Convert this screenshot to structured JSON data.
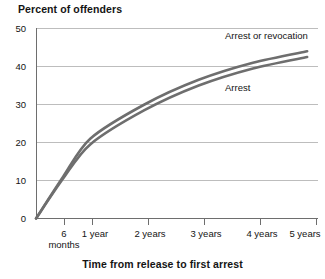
{
  "chart_data": {
    "type": "line",
    "title": "",
    "ylabel": "Percent of offenders",
    "xlabel": "Time from release to first arrest",
    "ylim": [
      0,
      50
    ],
    "yticks": [
      0,
      10,
      20,
      30,
      40,
      50
    ],
    "grid": true,
    "legend_position": "inline-labels",
    "categories": [
      "6 months",
      "1 year",
      "2 years",
      "3 years",
      "4 years",
      "5 years"
    ],
    "x_positions_years": [
      0.5,
      1,
      2,
      3,
      4,
      5
    ],
    "xlim_years": [
      0,
      5.2
    ],
    "series": [
      {
        "name": "Arrest or revocation",
        "values": [
          11,
          21,
          30,
          36.5,
          41,
          44
        ],
        "color": "#6e6e6e"
      },
      {
        "name": "Arrest",
        "values": [
          10.5,
          19.5,
          28.5,
          35,
          39.5,
          42.5
        ],
        "color": "#6e6e6e"
      }
    ],
    "annotations": [
      {
        "text": "Arrest or revocation",
        "x_px": 225,
        "y_px": 36
      },
      {
        "text": "Arrest",
        "x_px": 225,
        "y_px": 88
      }
    ]
  },
  "axis": {
    "y_tick_labels": [
      "50",
      "40",
      "30",
      "20",
      "10",
      "0"
    ],
    "x_tick_labels": [
      {
        "line1": "6",
        "line2": "months"
      },
      {
        "line1": "1 year",
        "line2": ""
      },
      {
        "line1": "2 years",
        "line2": ""
      },
      {
        "line1": "3 years",
        "line2": ""
      },
      {
        "line1": "4 years",
        "line2": ""
      },
      {
        "line1": "5 years",
        "line2": ""
      }
    ]
  },
  "labels": {
    "y_axis_title": "Percent of offenders",
    "x_axis_title": "Time from release to first arrest",
    "series_1": "Arrest or revocation",
    "series_2": "Arrest"
  },
  "colors": {
    "line": "#6e6e6e",
    "grid": "#bdbdbd",
    "axis": "#6e6e6e",
    "text": "#141414",
    "background": "#ffffff"
  }
}
